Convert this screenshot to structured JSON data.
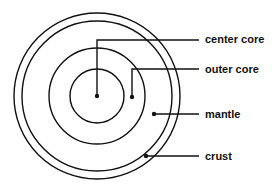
{
  "diagram": {
    "center": [
      97,
      96
    ],
    "colors": {
      "stroke": "#111111",
      "background": "#ffffff"
    },
    "rings": [
      {
        "name": "crust-outer",
        "r": 83
      },
      {
        "name": "crust-inner",
        "r": 75
      },
      {
        "name": "outer-core",
        "r": 48
      },
      {
        "name": "center-core",
        "r": 27
      }
    ],
    "labels": [
      {
        "id": "center-core",
        "text": "center core",
        "dot": [
          97,
          96
        ],
        "elbow": [
          97,
          40
        ],
        "line_end_x": 199,
        "text_y": 43
      },
      {
        "id": "outer-core",
        "text": "outer core",
        "dot": [
          132,
          97
        ],
        "elbow": [
          132,
          69
        ],
        "line_end_x": 199,
        "text_y": 72
      },
      {
        "id": "mantle",
        "text": "mantle",
        "dot": [
          154,
          114
        ],
        "line_end_x": 199,
        "text_y": 118
      },
      {
        "id": "crust",
        "text": "crust",
        "dot": [
          146,
          156
        ],
        "line_end_x": 199,
        "text_y": 160
      }
    ]
  }
}
